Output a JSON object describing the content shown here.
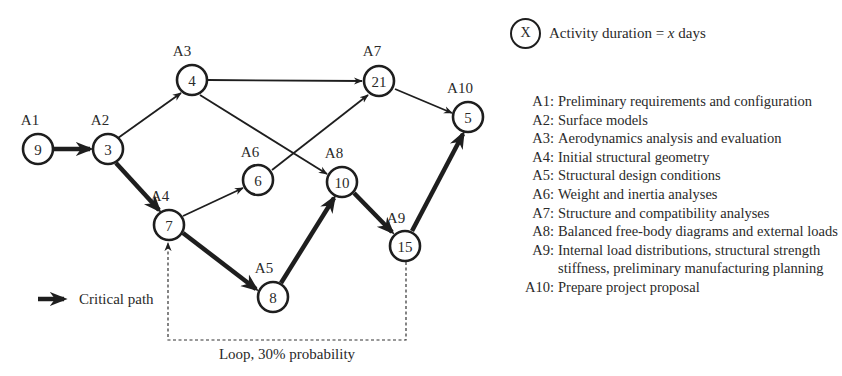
{
  "nodes": [
    {
      "id": "A1",
      "label": "A1",
      "duration": "9",
      "critical": true
    },
    {
      "id": "A2",
      "label": "A2",
      "duration": "3",
      "critical": true
    },
    {
      "id": "A3",
      "label": "A3",
      "duration": "4",
      "critical": false
    },
    {
      "id": "A4",
      "label": "A4",
      "duration": "7",
      "critical": true
    },
    {
      "id": "A5",
      "label": "A5",
      "duration": "8",
      "critical": true
    },
    {
      "id": "A6",
      "label": "A6",
      "duration": "6",
      "critical": false
    },
    {
      "id": "A7",
      "label": "A7",
      "duration": "21",
      "critical": false
    },
    {
      "id": "A8",
      "label": "A8",
      "duration": "10",
      "critical": true
    },
    {
      "id": "A9",
      "label": "A9",
      "duration": "15",
      "critical": true
    },
    {
      "id": "A10",
      "label": "A10",
      "duration": "5",
      "critical": true
    }
  ],
  "edges": [
    {
      "from": "A1",
      "to": "A2",
      "critical": true
    },
    {
      "from": "A2",
      "to": "A3",
      "critical": false
    },
    {
      "from": "A2",
      "to": "A4",
      "critical": true
    },
    {
      "from": "A3",
      "to": "A7",
      "critical": false
    },
    {
      "from": "A3",
      "to": "A8",
      "critical": false
    },
    {
      "from": "A4",
      "to": "A6",
      "critical": false
    },
    {
      "from": "A4",
      "to": "A5",
      "critical": true
    },
    {
      "from": "A6",
      "to": "A7",
      "critical": false
    },
    {
      "from": "A5",
      "to": "A8",
      "critical": true
    },
    {
      "from": "A8",
      "to": "A9",
      "critical": true
    },
    {
      "from": "A7",
      "to": "A10",
      "critical": false
    },
    {
      "from": "A9",
      "to": "A10",
      "critical": true
    }
  ],
  "loop": {
    "from": "A9",
    "to": "A4",
    "label": "Loop, 30% probability",
    "style": "dashed"
  },
  "legend": {
    "critical_path_label": "Critical path",
    "duration_key_symbol": "X",
    "duration_key_text_prefix": "Activity duration = ",
    "duration_key_var": "x",
    "duration_key_text_suffix": " days"
  },
  "activities": [
    {
      "code": "A1:",
      "description": "Preliminary requirements and configuration"
    },
    {
      "code": "A2:",
      "description": "Surface models"
    },
    {
      "code": "A3:",
      "description": "Aerodynamics analysis and evaluation"
    },
    {
      "code": "A4:",
      "description": "Initial structural geometry"
    },
    {
      "code": "A5:",
      "description": "Structural design conditions"
    },
    {
      "code": "A6:",
      "description": "Weight and inertia analyses"
    },
    {
      "code": "A7:",
      "description": "Structure and compatibility analyses"
    },
    {
      "code": "A8:",
      "description": "Balanced free-body diagrams and external loads"
    },
    {
      "code": "A9:",
      "description": "Internal load distributions, structural strength stiffness, preliminary manufacturing planning"
    },
    {
      "code": "A10:",
      "description": "Prepare project proposal"
    }
  ],
  "colors": {
    "line": "#1e1e1e",
    "text": "#2a2a2a",
    "background": "#ffffff"
  }
}
